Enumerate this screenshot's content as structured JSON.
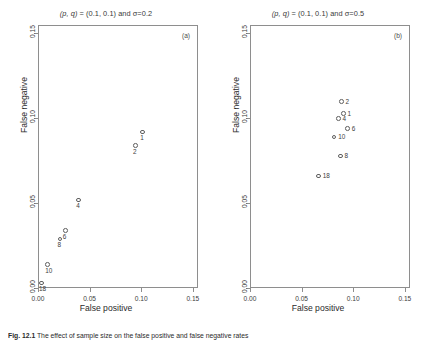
{
  "figure": {
    "caption_lead": "Fig. 12.1",
    "caption_text": "The effect of sample size on the false positive and false negative rates"
  },
  "axes": {
    "xlabel": "False positive",
    "ylabel": "False negative",
    "xticks": [
      "0.00",
      "0.05",
      "0.10",
      "0.15"
    ],
    "yticks": [
      "0.00",
      "0.05",
      "0.10",
      "0.15"
    ],
    "xlim": [
      0.0,
      0.155
    ],
    "ylim": [
      0.0,
      0.155
    ]
  },
  "chart_data": [
    {
      "type": "scatter",
      "panel": "a",
      "corner_label": "(a)",
      "title": "(p, q) = (0.1, 0.1) and σ=0.2",
      "title_params": "(p, q)",
      "title_rest": " = (0.1, 0.1) and σ=0.2",
      "xlabel": "False positive",
      "ylabel": "False negative",
      "xlim": [
        0.0,
        0.155
      ],
      "ylim": [
        0.0,
        0.155
      ],
      "grid": false,
      "label_position": "below",
      "point_labels": [
        "1",
        "2",
        "4",
        "6",
        "8",
        "10",
        "18"
      ],
      "x": [
        0.1005,
        0.0935,
        0.0385,
        0.0255,
        0.0205,
        0.0085,
        0.0025
      ],
      "y": [
        0.0925,
        0.0845,
        0.0525,
        0.0345,
        0.0295,
        0.0145,
        0.0035
      ]
    },
    {
      "type": "scatter",
      "panel": "b",
      "corner_label": "(b)",
      "title": "(p, q) = (0.1, 0.1) and σ=0.5",
      "title_params": "(p, q)",
      "title_rest": " = (0.1, 0.1) and σ=0.5",
      "xlabel": "False positive",
      "ylabel": "False negative",
      "xlim": [
        0.0,
        0.155
      ],
      "ylim": [
        0.0,
        0.155
      ],
      "grid": false,
      "label_position": "right",
      "point_labels": [
        "2",
        "1",
        "4",
        "6",
        "10",
        "8",
        "18"
      ],
      "x": [
        0.0875,
        0.0895,
        0.0845,
        0.0935,
        0.0805,
        0.0865,
        0.0655
      ],
      "y": [
        0.1105,
        0.1035,
        0.1005,
        0.0945,
        0.0895,
        0.0785,
        0.0665
      ]
    }
  ]
}
